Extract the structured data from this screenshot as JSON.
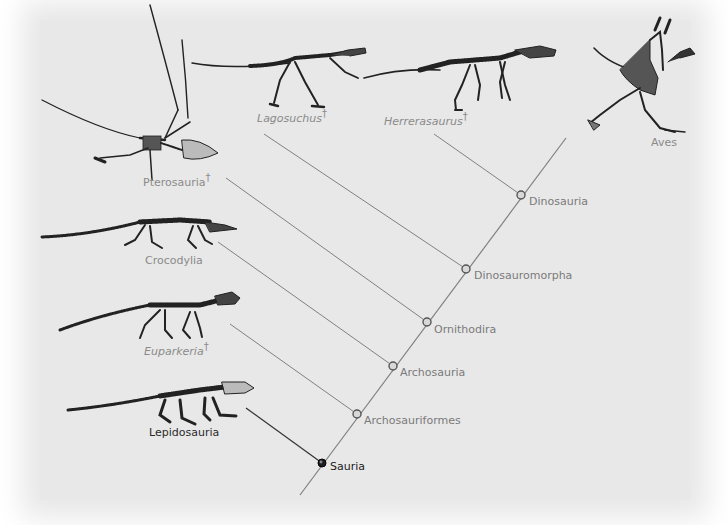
{
  "colors": {
    "background": "#e8e8e8",
    "branch_line": "#7f7f7f",
    "node_fill": "#d0d0d0",
    "node_stroke": "#555555",
    "root_node": "#222222",
    "label_gray": "#8a8a8a",
    "label_dark": "#2a2a2a"
  },
  "extinct_symbol": "†",
  "taxa": [
    {
      "name": "Lepidosauria",
      "extinct": false,
      "italic": false,
      "dark": true
    },
    {
      "name": "Euparkeria",
      "extinct": true,
      "italic": true,
      "dark": false
    },
    {
      "name": "Crocodylia",
      "extinct": false,
      "italic": false,
      "dark": false
    },
    {
      "name": "Pterosauria",
      "extinct": true,
      "italic": false,
      "dark": false
    },
    {
      "name": "Lagosuchus",
      "extinct": true,
      "italic": true,
      "dark": false
    },
    {
      "name": "Herrerasaurus",
      "extinct": true,
      "italic": true,
      "dark": false
    },
    {
      "name": "Aves",
      "extinct": false,
      "italic": false,
      "dark": false
    }
  ],
  "nodes": [
    {
      "name": "Sauria",
      "root": true
    },
    {
      "name": "Archosauriformes",
      "root": false
    },
    {
      "name": "Archosauria",
      "root": false
    },
    {
      "name": "Ornithodira",
      "root": false
    },
    {
      "name": "Dinosauromorpha",
      "root": false
    },
    {
      "name": "Dinosauria",
      "root": false
    }
  ]
}
